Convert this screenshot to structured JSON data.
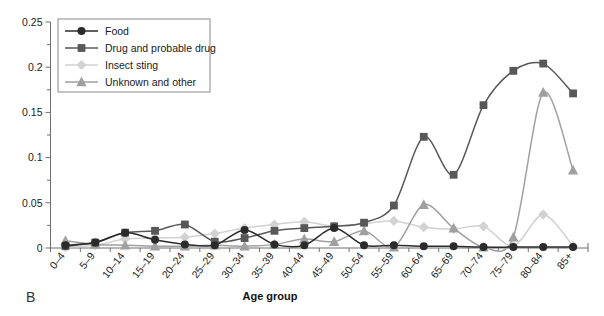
{
  "figure": {
    "panel_label": "B",
    "xlabel": "Age group",
    "ylabel": ""
  },
  "legend": {
    "position": "top-left-inside",
    "entries": [
      {
        "label": "Food",
        "marker": "circle",
        "color": "#2b2b2b"
      },
      {
        "label": "Drug and probable drug",
        "marker": "square",
        "color": "#585858"
      },
      {
        "label": "Insect sting",
        "marker": "diamond",
        "color": "#d2d2d2"
      },
      {
        "label": "Unknown and other",
        "marker": "triangle",
        "color": "#a0a0a0"
      }
    ]
  },
  "axes": {
    "y_ticks": [
      "0",
      "0.05",
      "0.1",
      "0.15",
      "0.2",
      "0.25"
    ],
    "y_tick_values": [
      0,
      0.05,
      0.1,
      0.15,
      0.2,
      0.25
    ],
    "y_minor_ticks": [
      0.025,
      0.075,
      0.125,
      0.175,
      0.225
    ],
    "ylim": [
      0,
      0.25
    ],
    "x_labels": [
      "0–4",
      "5–9",
      "10–14",
      "15–19",
      "20–24",
      "25–29",
      "30–34",
      "35–39",
      "40–44",
      "45–49",
      "50–54",
      "55–59",
      "60–64",
      "65–69",
      "70–74",
      "75–79",
      "80–84",
      "85+"
    ]
  },
  "chart_data": {
    "type": "line",
    "title": "",
    "xlabel": "Age group",
    "ylabel": "",
    "ylim": [
      0,
      0.25
    ],
    "grid": false,
    "legend_position": "upper left",
    "categories": [
      "0–4",
      "5–9",
      "10–14",
      "15–19",
      "20–24",
      "25–29",
      "30–34",
      "35–39",
      "40–44",
      "45–49",
      "50–54",
      "55–59",
      "60–64",
      "65–69",
      "70–74",
      "75–79",
      "80–84",
      "85+"
    ],
    "series": [
      {
        "name": "Food",
        "marker": "circle",
        "color": "#2b2b2b",
        "values": [
          0.003,
          0.006,
          0.017,
          0.009,
          0.004,
          0.003,
          0.02,
          0.004,
          0.003,
          0.022,
          0.003,
          0.003,
          0.002,
          0.002,
          0.001,
          0.001,
          0.001,
          0.001
        ]
      },
      {
        "name": "Drug and probable drug",
        "marker": "square",
        "color": "#585858",
        "values": [
          0.002,
          0.006,
          0.017,
          0.019,
          0.026,
          0.007,
          0.011,
          0.019,
          0.022,
          0.024,
          0.028,
          0.047,
          0.123,
          0.081,
          0.158,
          0.196,
          0.204,
          0.171
        ]
      },
      {
        "name": "Insect sting",
        "marker": "diamond",
        "color": "#d2d2d2",
        "values": [
          0.001,
          0.003,
          0.01,
          0.011,
          0.012,
          0.016,
          0.022,
          0.026,
          0.029,
          0.024,
          0.027,
          0.03,
          0.023,
          0.021,
          0.024,
          0.002,
          0.037,
          0.002
        ]
      },
      {
        "name": "Unknown and other",
        "marker": "triangle",
        "color": "#a0a0a0",
        "values": [
          0.008,
          0.004,
          0.003,
          0.002,
          0.002,
          0.003,
          0.002,
          0.004,
          0.01,
          0.007,
          0.019,
          0.001,
          0.048,
          0.022,
          0.001,
          0.012,
          0.172,
          0.086
        ]
      }
    ]
  }
}
